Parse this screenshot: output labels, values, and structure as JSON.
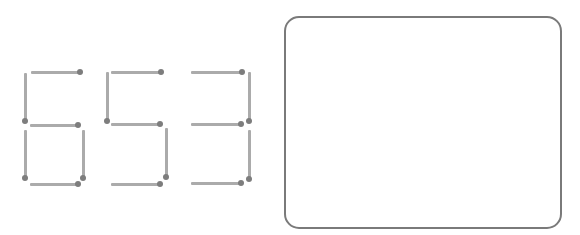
{
  "puzzle": {
    "digits_shown": "653",
    "colors": {
      "stick": "#ababab",
      "head": "#7d7d7d",
      "box_border": "#7a7a7a"
    },
    "matches": [
      {
        "digit": 0,
        "orient": "h",
        "x1": 31,
        "x2": 80,
        "y": 72,
        "head": "end"
      },
      {
        "digit": 0,
        "orient": "v",
        "x": 25,
        "y1": 73,
        "y2": 121,
        "head": "end"
      },
      {
        "digit": 0,
        "orient": "h",
        "x1": 30,
        "x2": 78,
        "y": 125,
        "head": "end"
      },
      {
        "digit": 0,
        "orient": "v",
        "x": 25,
        "y1": 130,
        "y2": 178,
        "head": "end"
      },
      {
        "digit": 0,
        "orient": "v",
        "x": 83,
        "y1": 130,
        "y2": 178,
        "head": "end"
      },
      {
        "digit": 0,
        "orient": "h",
        "x1": 30,
        "x2": 78,
        "y": 184,
        "head": "end"
      },
      {
        "digit": 1,
        "orient": "h",
        "x1": 111,
        "x2": 161,
        "y": 72,
        "head": "end"
      },
      {
        "digit": 1,
        "orient": "v",
        "x": 107,
        "y1": 72,
        "y2": 121,
        "head": "end"
      },
      {
        "digit": 1,
        "orient": "h",
        "x1": 111,
        "x2": 160,
        "y": 124,
        "head": "end"
      },
      {
        "digit": 1,
        "orient": "v",
        "x": 166,
        "y1": 128,
        "y2": 177,
        "head": "end"
      },
      {
        "digit": 1,
        "orient": "h",
        "x1": 111,
        "x2": 160,
        "y": 184,
        "head": "end"
      },
      {
        "digit": 2,
        "orient": "h",
        "x1": 191,
        "x2": 242,
        "y": 72,
        "head": "end"
      },
      {
        "digit": 2,
        "orient": "v",
        "x": 249,
        "y1": 72,
        "y2": 121,
        "head": "end"
      },
      {
        "digit": 2,
        "orient": "h",
        "x1": 191,
        "x2": 241,
        "y": 124,
        "head": "end"
      },
      {
        "digit": 2,
        "orient": "v",
        "x": 249,
        "y1": 130,
        "y2": 179,
        "head": "end"
      },
      {
        "digit": 2,
        "orient": "h",
        "x1": 191,
        "x2": 241,
        "y": 183,
        "head": "end"
      }
    ]
  },
  "answer_box": {
    "content": ""
  }
}
